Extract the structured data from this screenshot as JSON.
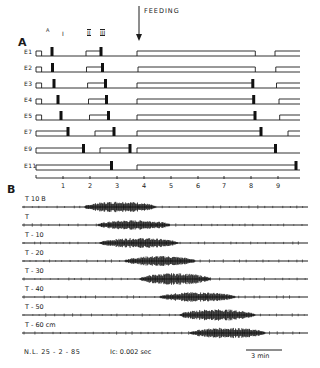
{
  "figure": {
    "panel_a": {
      "letter": "A",
      "event_label": "FEEDING",
      "phase_markers": [
        "I",
        "II",
        "III"
      ],
      "phase_marker_small": "A",
      "rows": [
        {
          "label": "E1",
          "y": 51,
          "on": [
            [
              36,
              41.6
            ],
            [
              86.0,
              101.4
            ],
            [
              137,
              255.3
            ],
            [
              275,
              300
            ]
          ],
          "spikes": [
            52,
            101
          ]
        },
        {
          "label": "E2",
          "y": 67,
          "on": [
            [
              36,
              41.6
            ],
            [
              86.5,
              102.5
            ],
            [
              138,
              255.3
            ],
            [
              275.8,
              300
            ]
          ],
          "spikes": [
            52.5,
            102.5
          ]
        },
        {
          "label": "E3",
          "y": 83,
          "on": [
            [
              36,
              41.6
            ],
            [
              87.6,
              105.5
            ],
            [
              137,
              252.8
            ],
            [
              276.5,
              300
            ]
          ],
          "spikes": [
            54,
            105.5,
            252.8
          ]
        },
        {
          "label": "E4",
          "y": 99,
          "on": [
            [
              36,
              41.6
            ],
            [
              88.5,
              106.5
            ],
            [
              137,
              253.7
            ],
            [
              279,
              300
            ]
          ],
          "spikes": [
            58,
            106.5,
            253.7
          ]
        },
        {
          "label": "E5",
          "y": 115,
          "on": [
            [
              36,
              41.6
            ],
            [
              89.5,
              108.5
            ],
            [
              137,
              255.0
            ],
            [
              279.7,
              300
            ]
          ],
          "spikes": [
            61,
            108.5,
            255
          ]
        },
        {
          "label": "E7",
          "y": 131,
          "on": [
            [
              36,
              68
            ],
            [
              95,
              114
            ],
            [
              137,
              261.0
            ],
            [
              288,
              300
            ]
          ],
          "spikes": [
            68,
            114,
            261
          ]
        },
        {
          "label": "E9",
          "y": 148,
          "on": [
            [
              36,
              83.5
            ],
            [
              100,
              130
            ],
            [
              137,
              275.5
            ]
          ],
          "spikes": [
            83.5,
            130,
            275.5
          ]
        },
        {
          "label": "E11",
          "y": 165,
          "on": [
            [
              36,
              111.5
            ],
            [
              137,
              296
            ]
          ],
          "spikes": [
            111.5,
            296
          ]
        }
      ],
      "axis": {
        "y": 178,
        "ticks": [
          "1",
          "2",
          "3",
          "4",
          "5",
          "6",
          "7",
          "8",
          "9"
        ],
        "tick_x": [
          63,
          90,
          117,
          144,
          171,
          198,
          224,
          251,
          278
        ]
      },
      "feeding_x": 139
    },
    "panel_b": {
      "letter": "B",
      "traces": [
        {
          "label": "T  10  B",
          "y": 207,
          "burst": [
            85,
            155
          ],
          "peak": 0.95
        },
        {
          "label": "T",
          "y": 225,
          "burst": [
            98,
            170
          ],
          "peak": 0.8
        },
        {
          "label": "T - 10",
          "y": 243,
          "burst": [
            100,
            178
          ],
          "peak": 0.85
        },
        {
          "label": "T - 20",
          "y": 261,
          "burst": [
            125,
            195
          ],
          "peak": 0.85
        },
        {
          "label": "T - 30",
          "y": 279,
          "burst": [
            140,
            210
          ],
          "peak": 1.0
        },
        {
          "label": "T - 40",
          "y": 297,
          "burst": [
            160,
            235
          ],
          "peak": 0.8
        },
        {
          "label": "T - 50",
          "y": 315,
          "burst": [
            180,
            255
          ],
          "peak": 1.0
        },
        {
          "label": "T - 60 cm",
          "y": 333,
          "burst": [
            190,
            265
          ],
          "peak": 0.9
        }
      ],
      "footer": {
        "left": "N.L. 25 - 2 - 85",
        "middle": "Ic: 0.002  sec",
        "scale_bar": "3 min"
      }
    }
  }
}
